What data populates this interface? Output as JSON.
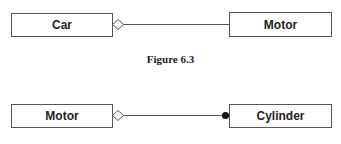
{
  "figures": [
    {
      "left_class": "Car",
      "right_class": "Motor",
      "left_end": "open-diamond",
      "right_end": "none",
      "caption": "Figure 6.3"
    },
    {
      "left_class": "Motor",
      "right_class": "Cylinder",
      "left_end": "open-diamond",
      "right_end": "filled-dot",
      "caption": ""
    }
  ],
  "colors": {
    "stroke": "#555555",
    "text": "#222222",
    "background": "#ffffff"
  }
}
